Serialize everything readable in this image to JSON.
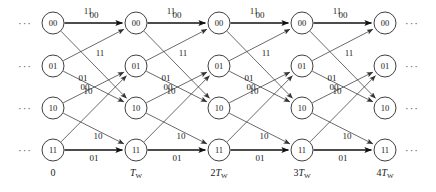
{
  "diagram": {
    "states": [
      "00",
      "01",
      "10",
      "11"
    ],
    "columns": 5,
    "time_labels": [
      "0",
      "Tw",
      "2Tw",
      "3Tw",
      "4Tw"
    ],
    "time_labels_display": [
      {
        "coef": "",
        "sym": "0",
        "sub": ""
      },
      {
        "coef": "",
        "sym": "T",
        "sub": "W"
      },
      {
        "coef": "2",
        "sym": "T",
        "sub": "W"
      },
      {
        "coef": "3",
        "sym": "T",
        "sub": "W"
      },
      {
        "coef": "4",
        "sym": "T",
        "sub": "W"
      }
    ],
    "ellipsis": "···",
    "colors": {
      "background": "#ffffff",
      "node_stroke": "#2b2b2b",
      "edge": "#3a3a3a",
      "edge_bold": "#111111",
      "text": "#1a1a1a"
    },
    "node_columns_x": [
      53,
      136,
      219,
      302,
      385
    ],
    "node_rows_y": [
      23,
      66,
      108,
      150
    ],
    "node_radius": 11,
    "transitions": [
      {
        "from": "00",
        "to": "00",
        "label": "00",
        "bold": true,
        "label_pos": "above"
      },
      {
        "from": "00",
        "to": "10",
        "label": "11",
        "bold": false,
        "label_pos": "diag"
      },
      {
        "from": "01",
        "to": "00",
        "label": "11",
        "bold": false,
        "label_pos": "diag"
      },
      {
        "from": "01",
        "to": "10",
        "label": "00",
        "bold": false,
        "label_pos": "diag"
      },
      {
        "from": "10",
        "to": "01",
        "label": "01",
        "bold": false,
        "label_pos": "diag"
      },
      {
        "from": "10",
        "to": "11",
        "label": "10",
        "bold": false,
        "label_pos": "diag"
      },
      {
        "from": "11",
        "to": "01",
        "label": "10",
        "bold": false,
        "label_pos": "diag"
      },
      {
        "from": "11",
        "to": "11",
        "label": "01",
        "bold": true,
        "label_pos": "below"
      }
    ],
    "edge_label_offsets": [
      {
        "key": "01-00",
        "dx": 35,
        "dy": -31
      },
      {
        "key": "00-10",
        "dx": 47,
        "dy": -10
      },
      {
        "key": "01-10",
        "dx": 32,
        "dy": 3
      },
      {
        "key": "10-01",
        "dx": 30,
        "dy": -6
      },
      {
        "key": "10-11",
        "dx": 45,
        "dy": 10
      },
      {
        "key": "11-01",
        "dx": 35,
        "dy": -14
      },
      {
        "key": "00-00",
        "dx": 41,
        "dy": -5
      },
      {
        "key": "11-11",
        "dx": 41,
        "dy": 11
      }
    ]
  }
}
